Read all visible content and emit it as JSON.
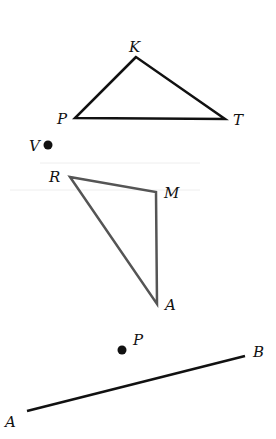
{
  "figure_1": {
    "type": "triangle",
    "stroke": "#111111",
    "vertices": [
      {
        "label": "K",
        "x": 136,
        "y": 57,
        "lx": 129,
        "ly": 52
      },
      {
        "label": "P",
        "x": 75,
        "y": 118,
        "lx": 57,
        "ly": 124
      },
      {
        "label": "T",
        "x": 225,
        "y": 119,
        "lx": 233,
        "ly": 125
      }
    ]
  },
  "point_v": {
    "label": "V",
    "x": 48,
    "y": 145,
    "lx": 29,
    "ly": 151,
    "color": "#111111"
  },
  "figure_2": {
    "type": "triangle",
    "stroke": "#555555",
    "vertices": [
      {
        "label": "R",
        "x": 70,
        "y": 177,
        "lx": 49,
        "ly": 182
      },
      {
        "label": "M",
        "x": 156,
        "y": 192,
        "lx": 164,
        "ly": 198
      },
      {
        "label": "A",
        "x": 157,
        "y": 304,
        "lx": 165,
        "ly": 310
      }
    ]
  },
  "point_p": {
    "label": "P",
    "x": 122,
    "y": 350,
    "lx": 133,
    "ly": 345,
    "color": "#111111"
  },
  "segment_ab": {
    "stroke": "#111111",
    "start": {
      "label": "A",
      "x": 27,
      "y": 411,
      "lx": 5,
      "ly": 427
    },
    "end": {
      "label": "B",
      "x": 245,
      "y": 356,
      "lx": 253,
      "ly": 357
    }
  }
}
